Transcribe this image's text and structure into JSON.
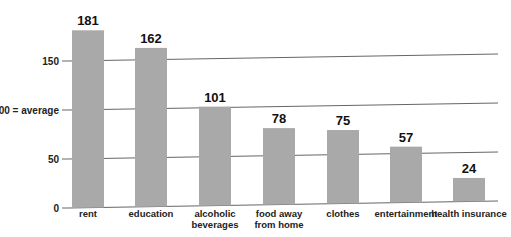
{
  "chart_data": {
    "type": "bar",
    "title": "",
    "xlabel": "",
    "ylabel": "",
    "categories": [
      "rent",
      "education",
      "alcoholic beverages",
      "food away from home",
      "clothes",
      "entertainment",
      "health insurance"
    ],
    "category_lines": [
      [
        "rent"
      ],
      [
        "education"
      ],
      [
        "alcoholic",
        "beverages"
      ],
      [
        "food away",
        "from home"
      ],
      [
        "clothes"
      ],
      [
        "entertainment"
      ],
      [
        "health insurance"
      ]
    ],
    "values": [
      181,
      162,
      101,
      78,
      75,
      57,
      24
    ],
    "data_labels": [
      "181",
      "162",
      "101",
      "78",
      "75",
      "57",
      "24"
    ],
    "yticks": [
      0,
      50,
      100,
      150
    ],
    "ytick_labels": [
      "0",
      "50",
      "100 = average",
      "150"
    ],
    "ylim": [
      0,
      190
    ],
    "grid": true,
    "legend": null,
    "colors": {
      "bar": "#a9a9a9",
      "grid": "#666666",
      "text": "#111111"
    }
  }
}
